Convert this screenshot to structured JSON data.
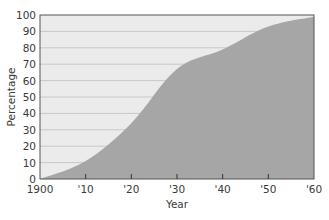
{
  "chart_data": {
    "type": "area",
    "title": "",
    "xlabel": "Year",
    "ylabel": "Percentage",
    "x": [
      1900,
      1910,
      1920,
      1930,
      1940,
      1950,
      1960
    ],
    "x_tick_labels": [
      "1900",
      "'10",
      "'20",
      "'30",
      "'40",
      "'50",
      "'60"
    ],
    "y_ticks": [
      0,
      10,
      20,
      30,
      40,
      50,
      60,
      70,
      80,
      90,
      100
    ],
    "y_tick_labels": [
      "0",
      "10",
      "20",
      "30",
      "40",
      "50",
      "60",
      "70",
      "80",
      "90",
      "100"
    ],
    "series": [
      {
        "name": "Percentage",
        "values": [
          0,
          11,
          34,
          67,
          79,
          93,
          99
        ]
      }
    ],
    "xlim": [
      1900,
      1960
    ],
    "ylim": [
      0,
      100
    ],
    "grid": true,
    "legend": "none",
    "colors": {
      "plot_background": "#ebebeb",
      "area_fill": "#a6a6a6",
      "gridline": "#c8c8c8",
      "axis": "#555555",
      "text": "#3a3a3a"
    }
  }
}
